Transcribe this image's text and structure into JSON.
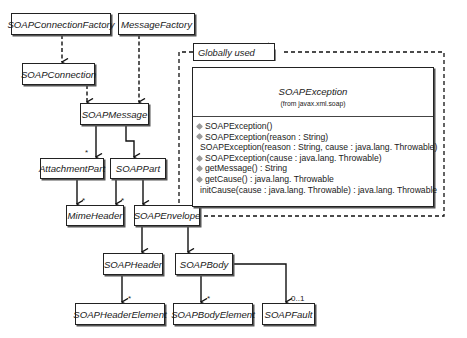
{
  "diagram": {
    "type": "UML class diagram",
    "classes": [
      {
        "id": "soap-connection-factory",
        "name": "SOAPConnectionFactory"
      },
      {
        "id": "message-factory",
        "name": "MessageFactory"
      },
      {
        "id": "soap-connection",
        "name": "SOAPConnection"
      },
      {
        "id": "soap-message",
        "name": "SOAPMessage"
      },
      {
        "id": "attachment-part",
        "name": "AttachmentPart"
      },
      {
        "id": "soap-part",
        "name": "SOAPPart"
      },
      {
        "id": "mime-header",
        "name": "MimeHeader"
      },
      {
        "id": "soap-envelope",
        "name": "SOAPEnvelope"
      },
      {
        "id": "soap-header",
        "name": "SOAPHeader"
      },
      {
        "id": "soap-body",
        "name": "SOAPBody"
      },
      {
        "id": "soap-header-element",
        "name": "SOAPHeaderElement"
      },
      {
        "id": "soap-body-element",
        "name": "SOAPBodyElement"
      },
      {
        "id": "soap-fault",
        "name": "SOAPFault"
      }
    ],
    "package": {
      "label": "Globally used",
      "class": {
        "name": "SOAPException",
        "from": "(from javax.xml.soap)",
        "operations": [
          "SOAPException()",
          "SOAPException(reason : String)",
          "SOAPException(reason : String, cause : java.lang. Throwable)",
          "SOAPException(cause : java.lang. Throwable)",
          "getMessage() : String",
          "getCause() : java.lang. Throwable",
          "initCause(cause : java.lang. Throwable) : java.lang. Throwable"
        ]
      }
    },
    "multiplicities": {
      "attachment_part": "*",
      "mime_header_from_attachment": "*",
      "mime_header_from_soappart": "*",
      "soap_header_element": "*",
      "soap_body_element": "*",
      "soap_fault": "0..1"
    },
    "relationships": [
      {
        "from": "SOAPConnectionFactory",
        "to": "SOAPConnection",
        "style": "dashed"
      },
      {
        "from": "SOAPConnection",
        "to": "SOAPMessage",
        "style": "dashed"
      },
      {
        "from": "MessageFactory",
        "to": "SOAPMessage",
        "style": "dashed"
      },
      {
        "from": "SOAPMessage",
        "to": "AttachmentPart",
        "style": "solid",
        "mult": "*"
      },
      {
        "from": "SOAPMessage",
        "to": "SOAPPart",
        "style": "solid"
      },
      {
        "from": "AttachmentPart",
        "to": "MimeHeader",
        "style": "solid",
        "mult": "*"
      },
      {
        "from": "SOAPPart",
        "to": "MimeHeader",
        "style": "solid",
        "mult": "*"
      },
      {
        "from": "SOAPPart",
        "to": "SOAPEnvelope",
        "style": "solid"
      },
      {
        "from": "SOAPEnvelope",
        "to": "SOAPHeader",
        "style": "solid"
      },
      {
        "from": "SOAPEnvelope",
        "to": "SOAPBody",
        "style": "solid"
      },
      {
        "from": "SOAPHeader",
        "to": "SOAPHeaderElement",
        "style": "solid",
        "mult": "*"
      },
      {
        "from": "SOAPBody",
        "to": "SOAPBodyElement",
        "style": "solid",
        "mult": "*"
      },
      {
        "from": "SOAPBody",
        "to": "SOAPFault",
        "style": "solid",
        "mult": "0..1"
      }
    ]
  }
}
